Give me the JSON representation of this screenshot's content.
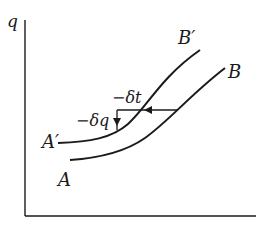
{
  "diagram": {
    "axis": {
      "y_label": "q",
      "x_label": ""
    },
    "curves": [
      {
        "id": "AB",
        "start_label": "A",
        "end_label": "B"
      },
      {
        "id": "A'B'",
        "start_label": "A′",
        "end_label": "B′"
      }
    ],
    "annotations": {
      "delta_t": "−δt",
      "delta_q": "−δq"
    },
    "colors": {
      "stroke": "#1a1a1a",
      "background": "#ffffff"
    }
  }
}
